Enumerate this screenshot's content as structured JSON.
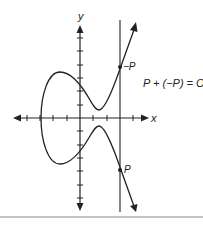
{
  "diagram": {
    "type": "elliptic-curve-point-addition",
    "axes": {
      "x_label": "x",
      "y_label": "y"
    },
    "points": {
      "neg_p_label": "−P",
      "p_label": "P"
    },
    "equation": "P + (−P) = O",
    "colors": {
      "ink": "#222222",
      "rule": "#888888",
      "background": "#ffffff"
    }
  }
}
